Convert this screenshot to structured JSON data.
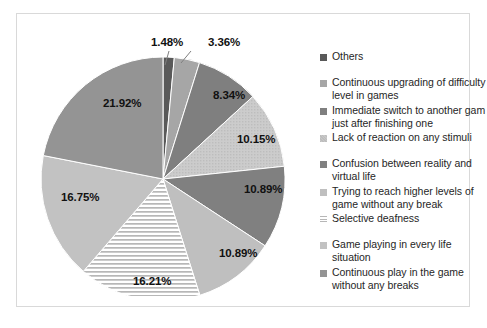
{
  "chart_data": {
    "type": "pie",
    "title": "",
    "legend_position": "right",
    "labels": [
      "Others",
      "Continuous upgrading of difficulty level in games",
      "Immediate switch to another gam just after finishing one",
      "Lack of reaction on any stimuli",
      "Confusion between reality and virtual life",
      "Trying to reach higher levels of game without any break",
      "Selective deafness",
      "Game playing in every life situation",
      "Continuous play in the game without any breaks"
    ],
    "values": [
      1.48,
      3.36,
      8.34,
      10.15,
      10.89,
      10.89,
      16.21,
      16.75,
      21.92
    ],
    "value_labels": [
      "1.48%",
      "3.36%",
      "8.34%",
      "10.15%",
      "10.89%",
      "10.89%",
      "16.21%",
      "16.75%",
      "21.92%"
    ],
    "unit": "%",
    "colors": [
      "#595959",
      "#a6a6a6",
      "#7f7f7f",
      "#c8c8c8",
      "#808080",
      "#bfbfbf",
      "#ffffff",
      "#c2c2c2",
      "#949494"
    ],
    "slice_patterns": [
      "solid",
      "solid",
      "solid",
      "fine-dots",
      "solid",
      "solid",
      "horizontal-stripes",
      "solid",
      "solid"
    ],
    "start_angle_deg": 0,
    "direction": "clockwise"
  },
  "pie": {
    "labels": [
      {
        "text": "1.48%",
        "x": 110,
        "y": 5,
        "leader": true
      },
      {
        "text": "3.36%",
        "x": 167,
        "y": 5,
        "leader": true
      },
      {
        "text": "8.34%",
        "x": 172,
        "y": 58,
        "leader": false
      },
      {
        "text": "10.15%",
        "x": 196,
        "y": 102,
        "leader": false
      },
      {
        "text": "10.89%",
        "x": 203,
        "y": 152,
        "leader": false
      },
      {
        "text": "10.89%",
        "x": 178,
        "y": 216,
        "leader": false
      },
      {
        "text": "16.21%",
        "x": 92,
        "y": 244,
        "leader": false
      },
      {
        "text": "16.75%",
        "x": 20,
        "y": 160,
        "leader": false
      },
      {
        "text": "21.92%",
        "x": 62,
        "y": 66,
        "leader": false
      }
    ]
  },
  "legend": {
    "items": [
      {
        "label": "Others",
        "color": "#595959",
        "pattern": "solid",
        "gap_after": true
      },
      {
        "label": "Continuous upgrading of difficulty level in games",
        "color": "#a6a6a6",
        "pattern": "solid",
        "gap_after": false
      },
      {
        "label": "Immediate switch to another gam just after finishing one",
        "color": "#7f7f7f",
        "pattern": "solid",
        "gap_after": false
      },
      {
        "label": "Lack of reaction on any stimuli",
        "color": "#c8c8c8",
        "pattern": "fine-dots",
        "gap_after": true
      },
      {
        "label": "Confusion between reality and virtual life",
        "color": "#808080",
        "pattern": "solid",
        "gap_after": false
      },
      {
        "label": "Trying to reach higher levels of game without any break",
        "color": "#bfbfbf",
        "pattern": "solid",
        "gap_after": false
      },
      {
        "label": "Selective deafness",
        "color": "#ffffff",
        "pattern": "horizontal-stripes",
        "gap_after": true
      },
      {
        "label": "Game playing in every life situation",
        "color": "#c2c2c2",
        "pattern": "solid",
        "gap_after": false
      },
      {
        "label": "Continuous play in the game without any breaks",
        "color": "#949494",
        "pattern": "solid",
        "gap_after": false
      }
    ]
  }
}
